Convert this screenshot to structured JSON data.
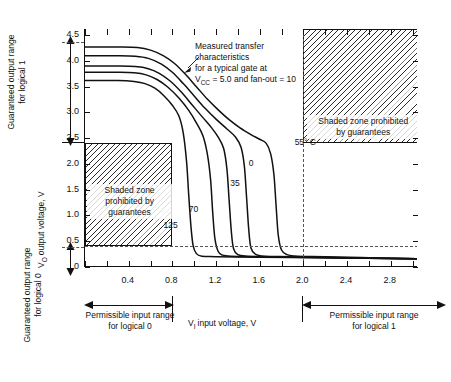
{
  "chart_data": {
    "type": "line",
    "title": "",
    "xlabel": "V₁, input voltage, V",
    "ylabel": "V₀, output voltage, V",
    "xlim": [
      0,
      3.05
    ],
    "ylim": [
      0,
      4.62
    ],
    "xticks": [
      0.4,
      0.8,
      1.2,
      1.6,
      2.0,
      2.4,
      2.8
    ],
    "xtick_labels": [
      "0.4",
      "0.8",
      "1.2",
      "1.6",
      "2.0",
      "2.4",
      "2.8"
    ],
    "xtick_minor_step": 0.2,
    "yticks": [
      0,
      0.5,
      1.0,
      1.5,
      2.0,
      2.5,
      3.0,
      3.5,
      4.0,
      4.5
    ],
    "ytick_labels": [
      "0",
      "0.5",
      "1.0",
      "1.5",
      "2.0",
      "2.5",
      "3.0",
      "3.5",
      "4.0",
      "4.5"
    ],
    "grid": false,
    "legend": "inline-curve-labels",
    "series": [
      {
        "name": "125",
        "label": "125",
        "temperature_c": 125,
        "points": [
          [
            0.0,
            3.62
          ],
          [
            0.3,
            3.62
          ],
          [
            0.45,
            3.6
          ],
          [
            0.55,
            3.56
          ],
          [
            0.64,
            3.47
          ],
          [
            0.72,
            3.33
          ],
          [
            0.8,
            3.14
          ],
          [
            0.86,
            2.93
          ],
          [
            0.9,
            2.6
          ],
          [
            0.93,
            2.05
          ],
          [
            0.95,
            1.4
          ],
          [
            0.97,
            0.8
          ],
          [
            0.99,
            0.42
          ],
          [
            1.02,
            0.26
          ],
          [
            1.07,
            0.21
          ],
          [
            1.2,
            0.2
          ],
          [
            1.6,
            0.19
          ],
          [
            2.2,
            0.18
          ],
          [
            3.05,
            0.16
          ]
        ]
      },
      {
        "name": "70",
        "label": "70",
        "temperature_c": 70,
        "points": [
          [
            0.0,
            3.78
          ],
          [
            0.3,
            3.78
          ],
          [
            0.45,
            3.77
          ],
          [
            0.56,
            3.73
          ],
          [
            0.66,
            3.64
          ],
          [
            0.76,
            3.49
          ],
          [
            0.86,
            3.28
          ],
          [
            0.95,
            3.04
          ],
          [
            1.02,
            2.8
          ],
          [
            1.08,
            2.55
          ],
          [
            1.12,
            2.2
          ],
          [
            1.15,
            1.7
          ],
          [
            1.17,
            1.05
          ],
          [
            1.19,
            0.55
          ],
          [
            1.22,
            0.3
          ],
          [
            1.26,
            0.23
          ],
          [
            1.34,
            0.21
          ],
          [
            1.6,
            0.2
          ],
          [
            2.2,
            0.18
          ],
          [
            3.05,
            0.16
          ]
        ]
      },
      {
        "name": "35",
        "label": "35",
        "temperature_c": 35,
        "points": [
          [
            0.0,
            3.9
          ],
          [
            0.3,
            3.9
          ],
          [
            0.46,
            3.89
          ],
          [
            0.58,
            3.85
          ],
          [
            0.68,
            3.76
          ],
          [
            0.78,
            3.61
          ],
          [
            0.88,
            3.4
          ],
          [
            0.98,
            3.15
          ],
          [
            1.08,
            2.9
          ],
          [
            1.16,
            2.7
          ],
          [
            1.22,
            2.52
          ],
          [
            1.27,
            2.3
          ],
          [
            1.3,
            1.9
          ],
          [
            1.32,
            1.3
          ],
          [
            1.34,
            0.7
          ],
          [
            1.36,
            0.36
          ],
          [
            1.4,
            0.24
          ],
          [
            1.48,
            0.21
          ],
          [
            1.7,
            0.2
          ],
          [
            2.3,
            0.18
          ],
          [
            3.05,
            0.16
          ]
        ]
      },
      {
        "name": "0",
        "label": "0",
        "temperature_c": 0,
        "points": [
          [
            0.0,
            4.1
          ],
          [
            0.3,
            4.1
          ],
          [
            0.46,
            4.09
          ],
          [
            0.58,
            4.05
          ],
          [
            0.7,
            3.94
          ],
          [
            0.8,
            3.78
          ],
          [
            0.9,
            3.56
          ],
          [
            1.0,
            3.32
          ],
          [
            1.1,
            3.08
          ],
          [
            1.2,
            2.87
          ],
          [
            1.3,
            2.68
          ],
          [
            1.38,
            2.52
          ],
          [
            1.43,
            2.32
          ],
          [
            1.46,
            1.95
          ],
          [
            1.48,
            1.35
          ],
          [
            1.5,
            0.72
          ],
          [
            1.52,
            0.37
          ],
          [
            1.56,
            0.25
          ],
          [
            1.64,
            0.21
          ],
          [
            1.9,
            0.2
          ],
          [
            2.4,
            0.18
          ],
          [
            3.05,
            0.16
          ]
        ]
      },
      {
        "name": "-55",
        "label": "−55° C",
        "temperature_c": -55,
        "points": [
          [
            0.0,
            4.27
          ],
          [
            0.3,
            4.27
          ],
          [
            0.48,
            4.26
          ],
          [
            0.6,
            4.21
          ],
          [
            0.72,
            4.1
          ],
          [
            0.82,
            3.95
          ],
          [
            0.92,
            3.74
          ],
          [
            1.02,
            3.5
          ],
          [
            1.12,
            3.26
          ],
          [
            1.22,
            3.05
          ],
          [
            1.32,
            2.86
          ],
          [
            1.42,
            2.7
          ],
          [
            1.52,
            2.57
          ],
          [
            1.6,
            2.48
          ],
          [
            1.66,
            2.4
          ],
          [
            1.7,
            2.2
          ],
          [
            1.73,
            1.8
          ],
          [
            1.75,
            1.2
          ],
          [
            1.77,
            0.62
          ],
          [
            1.8,
            0.33
          ],
          [
            1.85,
            0.24
          ],
          [
            1.95,
            0.21
          ],
          [
            2.2,
            0.2
          ],
          [
            2.6,
            0.18
          ],
          [
            3.05,
            0.16
          ]
        ]
      }
    ],
    "annotations": [
      {
        "name": "measured-transfer-note",
        "lines": [
          "Measured transfer",
          "characteristics",
          "for a typical gate at",
          "Vᴄᴄ = 5.0 and fan-out = 10"
        ]
      }
    ],
    "shaded_zones": [
      {
        "name": "logical-0-prohibited",
        "lines": [
          "Shaded zone",
          "prohibited by",
          "guarantees"
        ],
        "x_range": [
          0.0,
          0.8
        ],
        "y_range": [
          0.4,
          2.4
        ]
      },
      {
        "name": "logical-1-prohibited",
        "lines": [
          "Shaded zone prohibited",
          "by guarantees"
        ],
        "x_range": [
          2.0,
          3.05
        ],
        "y_range": [
          2.4,
          4.62
        ]
      }
    ]
  },
  "axis_note": {
    "vcc_sub": "CC",
    "vi_sub": "I",
    "vo_sub": "O"
  },
  "labels": {
    "x_axis": "input voltage, V",
    "x_axis_sym": "V",
    "y_axis": "output voltage, V",
    "y_axis_sym": "V",
    "guaranteed_out_1_l1": "Guaranteed output range",
    "guaranteed_out_1_l2": "for logical 1",
    "guaranteed_out_0_l1": "Guaranteed output range",
    "guaranteed_out_0_l2": "for logical 0",
    "permissible_in_0_l1": "Permissible input range",
    "permissible_in_0_l2": "for logical 0",
    "permissible_in_1_l1": "Permissible input range",
    "permissible_in_1_l2": "for logical 1"
  },
  "annotation_text": {
    "l1": "Measured transfer",
    "l2": "characteristics",
    "l3": "for a typical gate at",
    "l4_pre": "V",
    "l4_sub": "CC",
    "l4_post": " = 5.0 and fan-out = 10"
  },
  "zone_left": {
    "l1": "Shaded zone",
    "l2": "prohibited by",
    "l3": "guarantees"
  },
  "zone_right": {
    "l1": "Shaded zone prohibited",
    "l2": "by guarantees"
  },
  "curve_labels": {
    "c125": "125",
    "c70": "70",
    "c35": "35",
    "c0": "0",
    "cm55": "55° C"
  },
  "colors": {
    "ink": "#111111",
    "hatch": "#2a2a2a",
    "dash": "#555555"
  }
}
